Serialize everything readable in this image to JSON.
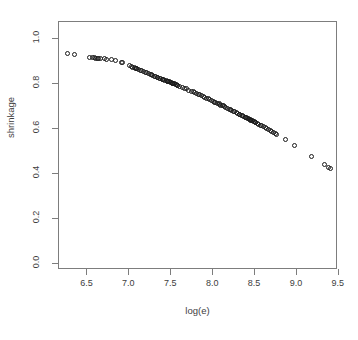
{
  "chart_data": {
    "type": "scatter",
    "title": "",
    "xlabel": "log(e)",
    "ylabel": "shrinkage",
    "xlim": [
      6.16,
      9.49
    ],
    "ylim": [
      -0.028,
      1.077
    ],
    "xticks": [
      6.5,
      7.0,
      7.5,
      8.0,
      8.5,
      9.0,
      9.5
    ],
    "xticklabels": [
      "6.5",
      "7.0",
      "7.5",
      "8.0",
      "8.5",
      "9.0",
      "9.5"
    ],
    "yticks": [
      0.0,
      0.2,
      0.4,
      0.6,
      0.8,
      1.0
    ],
    "yticklabels": [
      "0.0",
      "0.2",
      "0.4",
      "0.6",
      "0.8",
      "1.0"
    ],
    "grid": false,
    "legend": null,
    "marker": "open-circle",
    "marker_color": "#1a1a1a",
    "axis_color": "#7d7d7d",
    "background": "#ffffff",
    "n_points": 132,
    "x": [
      6.26,
      6.34,
      6.52,
      6.56,
      6.58,
      6.6,
      6.62,
      6.63,
      6.7,
      6.73,
      6.79,
      6.84,
      6.9,
      6.92,
      7.0,
      7.02,
      7.04,
      7.06,
      7.07,
      7.09,
      7.11,
      7.13,
      7.15,
      7.17,
      7.19,
      7.21,
      7.23,
      7.25,
      7.26,
      7.28,
      7.3,
      7.31,
      7.33,
      7.34,
      7.36,
      7.37,
      7.39,
      7.4,
      7.41,
      7.42,
      7.44,
      7.45,
      7.46,
      7.47,
      7.48,
      7.49,
      7.5,
      7.51,
      7.52,
      7.53,
      7.55,
      7.57,
      7.6,
      7.63,
      7.66,
      7.71,
      7.74,
      7.76,
      7.78,
      7.8,
      7.82,
      7.84,
      7.86,
      7.88,
      7.9,
      7.92,
      7.94,
      7.96,
      7.98,
      8.0,
      8.02,
      8.03,
      8.05,
      8.07,
      8.09,
      8.11,
      8.13,
      8.15,
      8.17,
      8.19,
      8.21,
      8.22,
      8.24,
      8.26,
      8.28,
      8.29,
      8.31,
      8.32,
      8.34,
      8.35,
      8.36,
      8.38,
      8.39,
      8.4,
      8.41,
      8.42,
      8.44,
      8.45,
      8.46,
      8.47,
      8.48,
      8.5,
      8.51,
      8.53,
      8.54,
      8.56,
      8.58,
      8.6,
      8.62,
      8.64,
      8.66,
      8.68,
      8.7,
      8.72,
      8.74,
      8.76,
      8.86,
      8.97,
      9.17,
      9.33,
      9.38,
      9.4,
      7.54,
      7.56,
      7.58,
      7.68,
      8.07,
      8.12,
      8.43,
      8.49,
      6.66,
      7.08
    ],
    "y": [
      0.937,
      0.93,
      0.92,
      0.918,
      0.917,
      0.916,
      0.916,
      0.915,
      0.913,
      0.911,
      0.908,
      0.904,
      0.897,
      0.895,
      0.883,
      0.88,
      0.876,
      0.873,
      0.871,
      0.868,
      0.865,
      0.862,
      0.859,
      0.856,
      0.853,
      0.85,
      0.847,
      0.844,
      0.842,
      0.839,
      0.836,
      0.834,
      0.831,
      0.83,
      0.827,
      0.825,
      0.822,
      0.821,
      0.819,
      0.818,
      0.815,
      0.814,
      0.812,
      0.811,
      0.81,
      0.808,
      0.807,
      0.805,
      0.804,
      0.802,
      0.799,
      0.796,
      0.791,
      0.787,
      0.782,
      0.774,
      0.769,
      0.766,
      0.763,
      0.759,
      0.756,
      0.752,
      0.749,
      0.745,
      0.742,
      0.738,
      0.735,
      0.731,
      0.728,
      0.724,
      0.72,
      0.718,
      0.715,
      0.711,
      0.707,
      0.704,
      0.7,
      0.696,
      0.693,
      0.689,
      0.685,
      0.683,
      0.679,
      0.676,
      0.672,
      0.67,
      0.666,
      0.665,
      0.661,
      0.659,
      0.657,
      0.653,
      0.652,
      0.65,
      0.648,
      0.646,
      0.642,
      0.64,
      0.638,
      0.636,
      0.634,
      0.63,
      0.628,
      0.624,
      0.622,
      0.618,
      0.614,
      0.61,
      0.606,
      0.602,
      0.598,
      0.594,
      0.59,
      0.586,
      0.581,
      0.577,
      0.553,
      0.527,
      0.478,
      0.44,
      0.428,
      0.424,
      0.801,
      0.798,
      0.794,
      0.779,
      0.712,
      0.703,
      0.644,
      0.632,
      0.914,
      0.87
    ]
  }
}
